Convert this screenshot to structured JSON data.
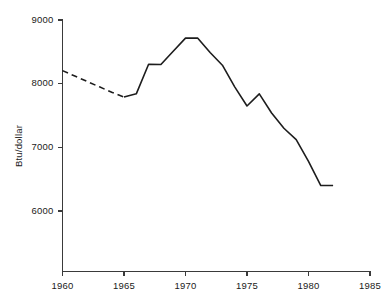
{
  "chart_data": {
    "type": "line",
    "title": "",
    "xlabel": "",
    "ylabel": "Btu/dollar",
    "xlim": [
      1960,
      1985
    ],
    "ylim": [
      5400,
      9000
    ],
    "grid": false,
    "legend": "none",
    "xticks": [
      1960,
      1965,
      1970,
      1975,
      1980,
      1985
    ],
    "xtick_labels": [
      "1960",
      "1965",
      "1970",
      "1975",
      "1980",
      "1985"
    ],
    "yticks": [
      6000,
      7000,
      8000,
      9000
    ],
    "ytick_labels": [
      "6000",
      "7000",
      "8000",
      "9000"
    ],
    "series": [
      {
        "name": "Btu per dollar of GNP",
        "style": "dashed",
        "note": "estimated / interpolated early segment",
        "x": [
          1960,
          1961,
          1962,
          1963,
          1964,
          1965
        ],
        "values": [
          8205,
          8120,
          8035,
          7950,
          7865,
          7790
        ]
      },
      {
        "name": "Btu per dollar of GNP",
        "style": "solid",
        "x": [
          1965,
          1966,
          1967,
          1968,
          1969,
          1970,
          1971,
          1972,
          1973,
          1974,
          1975,
          1976,
          1977,
          1978,
          1979,
          1980,
          1981,
          1982
        ],
        "values": [
          7790,
          7840,
          8305,
          8300,
          8510,
          8715,
          8715,
          8490,
          8290,
          7950,
          7650,
          7840,
          7540,
          7300,
          7120,
          6780,
          6400,
          6400
        ]
      }
    ]
  },
  "axis": {
    "y_label": "Btu/dollar"
  }
}
